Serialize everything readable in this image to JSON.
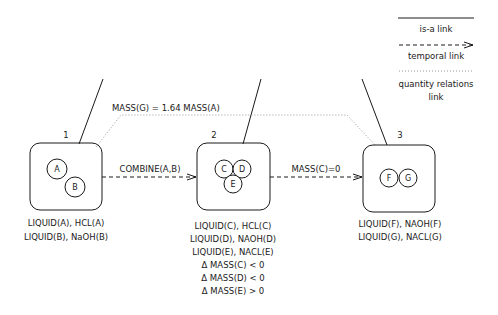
{
  "legend": {
    "isa": "is-a link",
    "temporal": "temporal link",
    "quantity_line1": "quantity relations",
    "quantity_line2": "link"
  },
  "quantity_relation": "MASS(G) = 1.64 MASS(A)",
  "states": [
    {
      "number": "1",
      "substances": [
        "A",
        "B"
      ],
      "facts": [
        "LIQUID(A), HCL(A)",
        "LIQUID(B), NaOH(B)"
      ]
    },
    {
      "number": "2",
      "substances": [
        "C",
        "D",
        "E"
      ],
      "facts": [
        "LIQUID(C), HCL(C)",
        "LIQUID(D), NAOH(D)",
        "LIQUID(E), NACL(E)",
        "Δ MASS(C) < 0",
        "Δ MASS(D) < 0",
        "Δ MASS(E) > 0"
      ]
    },
    {
      "number": "3",
      "substances": [
        "F",
        "G"
      ],
      "facts": [
        "LIQUID(F), NAOH(F)",
        "LIQUID(G), NACL(G)"
      ]
    }
  ],
  "transitions": [
    {
      "label": "COMBINE(A,B)"
    },
    {
      "label": "MASS(C)=0"
    }
  ],
  "colors": {
    "line": "#1a1a1a",
    "dotted": "#9a9a9a"
  }
}
